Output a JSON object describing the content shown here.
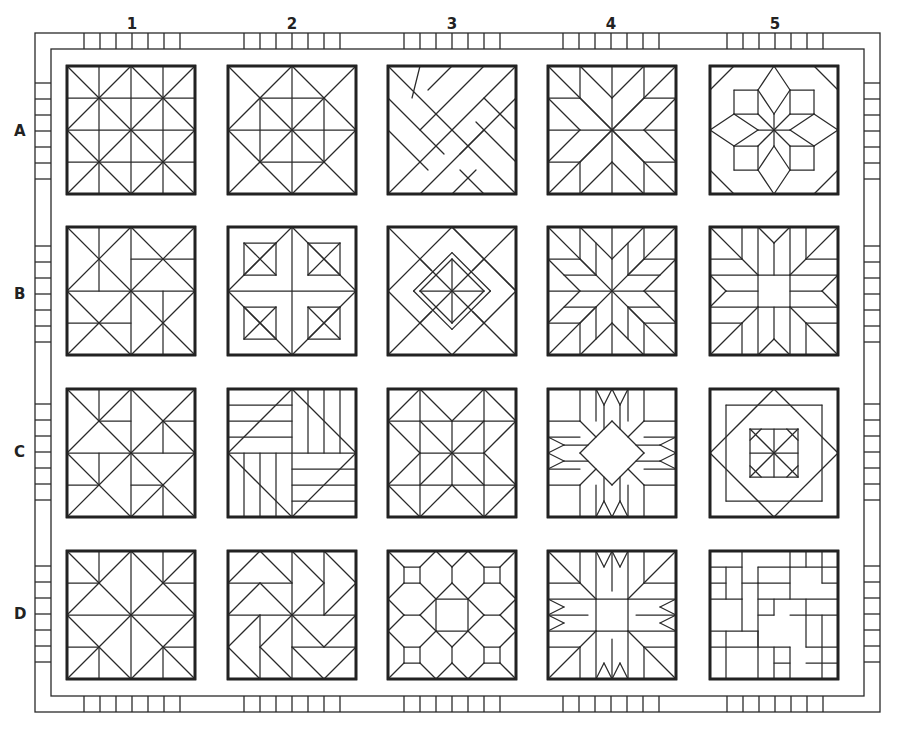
{
  "diagram": {
    "type": "quilt-sampler-grid",
    "columns": [
      "1",
      "2",
      "3",
      "4",
      "5"
    ],
    "rows": [
      "A",
      "B",
      "C",
      "D"
    ],
    "colors": {
      "line": "#2a2a2a",
      "background": "#ffffff"
    },
    "blocks": [
      {
        "id": "A1",
        "row": "A",
        "col": "1",
        "pattern": "diagonal-grid-4x4"
      },
      {
        "id": "A2",
        "row": "A",
        "col": "2",
        "pattern": "square-in-diamond-pinwheel"
      },
      {
        "id": "A3",
        "row": "A",
        "col": "3",
        "pattern": "woven-diagonal-strips"
      },
      {
        "id": "A4",
        "row": "A",
        "col": "4",
        "pattern": "eight-point-star"
      },
      {
        "id": "A5",
        "row": "A",
        "col": "5",
        "pattern": "star-with-square-corners"
      },
      {
        "id": "B1",
        "row": "B",
        "col": "1",
        "pattern": "offset-hourglass-triangles"
      },
      {
        "id": "B2",
        "row": "B",
        "col": "2",
        "pattern": "cross-with-corner-squares"
      },
      {
        "id": "B3",
        "row": "B",
        "col": "3",
        "pattern": "nested-diamond"
      },
      {
        "id": "B4",
        "row": "B",
        "col": "4",
        "pattern": "lemoyne-star"
      },
      {
        "id": "B5",
        "row": "B",
        "col": "5",
        "pattern": "star-with-center-square"
      },
      {
        "id": "C1",
        "row": "C",
        "col": "1",
        "pattern": "broken-dishes-triangles"
      },
      {
        "id": "C2",
        "row": "C",
        "col": "2",
        "pattern": "rail-fence-pinwheel"
      },
      {
        "id": "C3",
        "row": "C",
        "col": "3",
        "pattern": "sawtooth-star-variant"
      },
      {
        "id": "C4",
        "row": "C",
        "col": "4",
        "pattern": "star-with-center-diamond"
      },
      {
        "id": "C5",
        "row": "C",
        "col": "5",
        "pattern": "square-in-square-pinwheel"
      },
      {
        "id": "D1",
        "row": "D",
        "col": "1",
        "pattern": "diagonal-grid-variant"
      },
      {
        "id": "D2",
        "row": "D",
        "col": "2",
        "pattern": "flying-geese-pinwheel"
      },
      {
        "id": "D3",
        "row": "D",
        "col": "3",
        "pattern": "octagons-and-squares"
      },
      {
        "id": "D4",
        "row": "D",
        "col": "4",
        "pattern": "star-with-center-square-large"
      },
      {
        "id": "D5",
        "row": "D",
        "col": "5",
        "pattern": "random-rectangles"
      }
    ]
  }
}
